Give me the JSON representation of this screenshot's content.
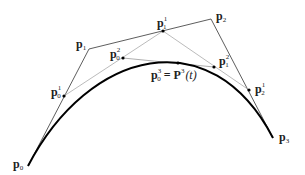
{
  "diagram": {
    "colors": {
      "background": "#ffffff",
      "control_polygon": "#333333",
      "construction_lines": "#aaaaaa",
      "curve": "#000000",
      "points": "#000000",
      "labels": "#222222"
    },
    "control_points": [
      {
        "id": "P0",
        "label": "p",
        "sub": "0",
        "sup": "",
        "x": 28,
        "y": 166
      },
      {
        "id": "P1",
        "label": "p",
        "sub": "1",
        "sup": "",
        "x": 89,
        "y": 49
      },
      {
        "id": "P2",
        "label": "p",
        "sub": "2",
        "sup": "",
        "x": 211,
        "y": 19
      },
      {
        "id": "P3",
        "label": "p",
        "sub": "3",
        "sup": "",
        "x": 273,
        "y": 138
      }
    ],
    "level1_points": [
      {
        "id": "P0_1",
        "label": "p",
        "sub": "0",
        "sup": "1",
        "x": 64,
        "y": 96
      },
      {
        "id": "P1_1",
        "label": "p",
        "sub": "1",
        "sup": "1",
        "x": 163,
        "y": 31
      },
      {
        "id": "P2_1",
        "label": "p",
        "sub": "2",
        "sup": "1",
        "x": 249,
        "y": 90
      }
    ],
    "level2_points": [
      {
        "id": "P0_2",
        "label": "p",
        "sub": "0",
        "sup": "2",
        "x": 123,
        "y": 58
      },
      {
        "id": "P1_2",
        "label": "p",
        "sub": "1",
        "sup": "2",
        "x": 214,
        "y": 67
      }
    ],
    "curve_point": {
      "id": "P0_3",
      "label": "p",
      "sub": "0",
      "sup": "3",
      "equals": "=",
      "rhs_label": "P",
      "rhs_sup": "3",
      "rhs_arg": "(t)",
      "x": 178,
      "y": 63
    },
    "curve": {
      "type": "cubic-bezier",
      "from": "P0",
      "to": "P3"
    }
  }
}
